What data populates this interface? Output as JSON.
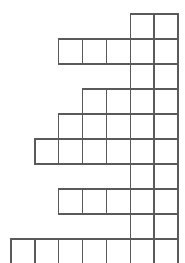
{
  "figure": {
    "kind": "crossword-staircase-grid",
    "background_color": "#ffffff",
    "stroke_color": "#5a5a5a",
    "cell_fill_color": "#ffffff",
    "stroke_width": 1.4,
    "canvas": {
      "width": 185,
      "height": 263
    }
  },
  "grid": {
    "origin_x": 11,
    "origin_y": 14,
    "cell_width": 23.85,
    "cell_height": 25.0,
    "columns": 7,
    "rows": 9,
    "column_edges": [
      11,
      34.85,
      58.7,
      82.55,
      106.4,
      130.25,
      154.1,
      177.95
    ],
    "row_edges": [
      14,
      39,
      64,
      89,
      114,
      139,
      164,
      189,
      214,
      239
    ],
    "rows_data": [
      {
        "index": 0,
        "start_col": 5,
        "cell_count": 2
      },
      {
        "index": 1,
        "start_col": 2,
        "cell_count": 5
      },
      {
        "index": 2,
        "start_col": 5,
        "cell_count": 2
      },
      {
        "index": 3,
        "start_col": 3,
        "cell_count": 4
      },
      {
        "index": 4,
        "start_col": 2,
        "cell_count": 5
      },
      {
        "index": 5,
        "start_col": 1,
        "cell_count": 6
      },
      {
        "index": 6,
        "start_col": 5,
        "cell_count": 2
      },
      {
        "index": 7,
        "start_col": 2,
        "cell_count": 5
      },
      {
        "index": 8,
        "start_col": 5,
        "cell_count": 2
      },
      {
        "index": 9,
        "start_col": 0,
        "cell_count": 7
      }
    ]
  }
}
